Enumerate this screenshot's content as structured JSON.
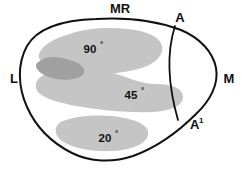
{
  "figure": {
    "background_color": "#ffffff",
    "outline_color": "#111111",
    "band_color": "#c5c5c5",
    "band_overlap_color": "#a0a0a0"
  },
  "orientation_labels": {
    "top": "MR",
    "left": "L",
    "right": "M",
    "upper_right": "A",
    "lower_right_base": "A",
    "lower_right_superscript": "1"
  },
  "angle_bands": [
    {
      "label": "90",
      "degree_symbol": "°",
      "value": 90
    },
    {
      "label": "45",
      "degree_symbol": "°",
      "value": 45
    },
    {
      "label": "20",
      "degree_symbol": "°",
      "value": 20
    }
  ]
}
